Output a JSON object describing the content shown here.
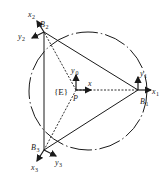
{
  "diagram": {
    "type": "parallel mechanism kinematic schematic",
    "frame_label": "{E}",
    "center_point": {
      "label": "P",
      "axes": {
        "x": "x",
        "y": "y",
        "y_sub": "0"
      }
    },
    "joints": [
      {
        "label": "B",
        "sub": "1",
        "axes": {
          "x": "x",
          "x_sub": "1",
          "y": "y",
          "y_sub": "1"
        }
      },
      {
        "label": "B",
        "sub": "2",
        "axes": {
          "x": "x",
          "x_sub": "2",
          "y": "y",
          "y_sub": "2"
        }
      },
      {
        "label": "B",
        "sub": "3",
        "axes": {
          "x": "x",
          "x_sub": "3",
          "y": "y",
          "y_sub": "3"
        }
      }
    ],
    "colors": {
      "stroke": "#1a1a1a",
      "background": "#ffffff"
    }
  }
}
